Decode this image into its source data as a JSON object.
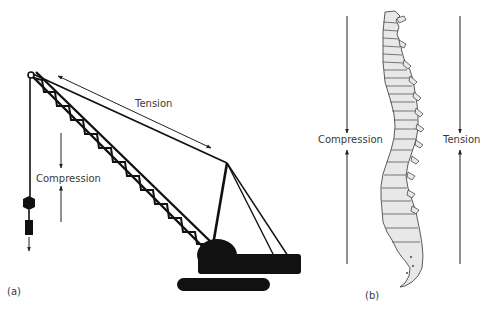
{
  "panel_a": {
    "caption": "(a)",
    "subject": "crawler crane",
    "labels": {
      "tension": "Tension",
      "compression": "Compression"
    },
    "arrows": {
      "tension": "double-headed arrow along boom cable",
      "compression": "opposing vertical arrows pointing toward each other"
    }
  },
  "panel_b": {
    "caption": "(b)",
    "subject": "human vertebral column (lateral view)",
    "labels": {
      "compression": "Compression",
      "tension": "Tension"
    },
    "arrows": {
      "compression": "opposing vertical arrows pointing toward label (anterior side)",
      "tension": "opposing vertical arrows pointing toward label (posterior side)"
    }
  },
  "colors": {
    "ink": "#111111",
    "text": "#3a3a3a",
    "bone_fill": "#e8e8e8",
    "background": "#ffffff"
  }
}
